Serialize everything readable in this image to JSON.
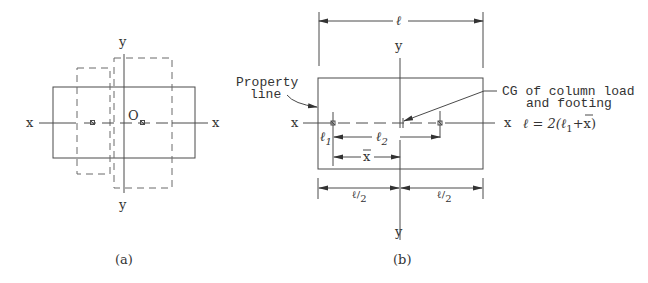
{
  "diagram": {
    "panel_a": {
      "caption": "(a)",
      "axis_x_left": "x",
      "axis_x_right": "x",
      "axis_y_top": "y",
      "axis_y_bottom": "y",
      "origin_label": "O"
    },
    "panel_b": {
      "caption": "(b)",
      "axis_x_left": "x",
      "axis_x_right": "x",
      "axis_y_top": "y",
      "axis_y_bottom": "y",
      "total_length_label": "ℓ",
      "property_line_label_1": "Property",
      "property_line_label_2": "line",
      "cg_label_1": "CG of column load",
      "cg_label_2": "and footing",
      "l1_label": "ℓ",
      "l1_sub": "1",
      "l2_label": "ℓ",
      "l2_sub": "2",
      "xbar_label": "x",
      "half_left_num": "ℓ",
      "half_left_den": "2",
      "half_right_num": "ℓ",
      "half_right_den": "2",
      "formula": "ℓ = 2(ℓ",
      "formula_sub": "1",
      "formula_tail": "+x)"
    },
    "colors": {
      "line": "#4a4a4a",
      "text": "#333333",
      "background": "#ffffff"
    }
  }
}
